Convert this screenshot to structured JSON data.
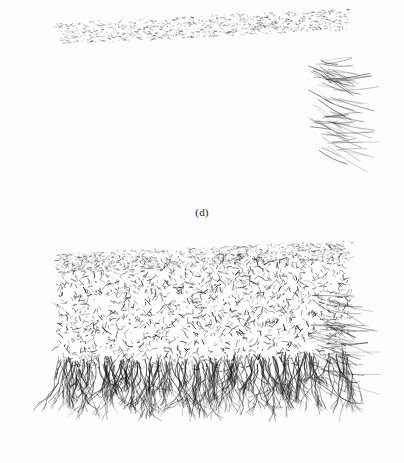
{
  "figure": {
    "title": "",
    "background_color": "#fdfdfd",
    "ink_color": "#1a1a1a",
    "width": 404,
    "height": 463,
    "panel_count": 2,
    "rendering": "grayscale wireframe mesh, 3D perspective view"
  },
  "panels": [
    {
      "id": "d",
      "caption": "(d)",
      "caption_y": 215,
      "bounds": {
        "x": 22,
        "y": 8,
        "width": 363,
        "height": 195
      },
      "front_face": "corrugated",
      "ridge_count": 7,
      "description": "dense 3D wireframe mesh slab in perspective with periodic corrugated ridges along the front face and sparse branching filaments hanging below",
      "mesh": {
        "top_face_depth": 26,
        "skew_x": 36,
        "body_top": 34,
        "body_bottom": 132,
        "strand_count": 2600,
        "filament_count": 150,
        "filament_max_length": 62,
        "speckle_count": 260,
        "ridge_amplitude": 17,
        "ridge_phase": 0.35,
        "density_top": 0.95,
        "density_bottom": 0.28,
        "right_fringe": true
      }
    },
    {
      "id": "e",
      "caption": "(e)",
      "caption_y": 443,
      "bounds": {
        "x": 22,
        "y": 238,
        "width": 363,
        "height": 180
      },
      "front_face": "uniform",
      "ridge_count": 0,
      "description": "dense 3D wireframe mesh slab in perspective with a uniform front face and prominent branching root filaments hanging below",
      "mesh": {
        "top_face_depth": 24,
        "skew_x": 36,
        "body_top": 30,
        "body_bottom": 128,
        "strand_count": 2900,
        "filament_count": 185,
        "filament_max_length": 72,
        "speckle_count": 300,
        "ridge_amplitude": 0,
        "ridge_phase": 0,
        "density_top": 0.97,
        "density_bottom": 0.3,
        "right_fringe": true
      }
    }
  ],
  "chart_data": {
    "type": "scatter",
    "title": "",
    "xlabel": "",
    "ylabel": "",
    "legend": [],
    "grid": false,
    "series": [
      {
        "name": "(d) corrugated mesh",
        "ridge_count": 7,
        "ridge_amplitude": 17,
        "strand_count": 2600,
        "filament_count": 150
      },
      {
        "name": "(e) uniform mesh",
        "ridge_count": 0,
        "ridge_amplitude": 0,
        "strand_count": 2900,
        "filament_count": 185
      }
    ]
  }
}
